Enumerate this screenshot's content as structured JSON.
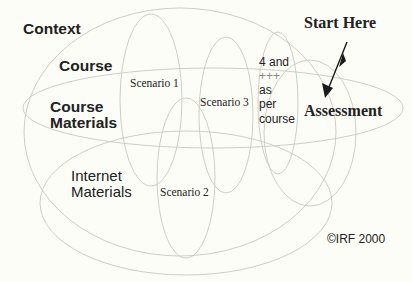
{
  "diagram": {
    "labels": {
      "context": "Context",
      "course": "Course",
      "course_materials_line1": "Course",
      "course_materials_line2": "Materials",
      "internet_materials_line1": "Internet",
      "internet_materials_line2": "Materials",
      "scenario1": "Scenario 1",
      "scenario2": "Scenario 2",
      "scenario3": "Scenario 3",
      "scenario4_line1": "4 and",
      "scenario4_line2": "+++",
      "scenario4_line3": "as",
      "scenario4_line4": "per",
      "scenario4_line5": "course",
      "assessment": "Assessment",
      "start_here": "Start Here",
      "copyright": "©IRF 2000"
    },
    "colors": {
      "background": "#fdfdf8",
      "ellipse_stroke": "#c8c8c0",
      "text": "#222222",
      "arrow": "#1a1a1a"
    },
    "ellipses": [
      {
        "name": "context",
        "cx": 180,
        "cy": 132,
        "rx": 156,
        "ry": 124
      },
      {
        "name": "course",
        "cx": 213,
        "cy": 108,
        "rx": 190,
        "ry": 40
      },
      {
        "name": "materials",
        "cx": 186,
        "cy": 203,
        "rx": 146,
        "ry": 72
      },
      {
        "name": "scenario1",
        "cx": 151,
        "cy": 100,
        "rx": 31,
        "ry": 86
      },
      {
        "name": "scenario2",
        "cx": 186,
        "cy": 178,
        "rx": 29,
        "ry": 80
      },
      {
        "name": "scenario3",
        "cx": 226,
        "cy": 115,
        "rx": 27,
        "ry": 78
      },
      {
        "name": "scenario4",
        "cx": 278,
        "cy": 103,
        "rx": 20,
        "ry": 71
      },
      {
        "name": "assessment",
        "cx": 310,
        "cy": 133,
        "rx": 46,
        "ry": 73
      }
    ],
    "arrow": {
      "from": [
        348,
        42
      ],
      "to": [
        325,
        98
      ]
    }
  }
}
